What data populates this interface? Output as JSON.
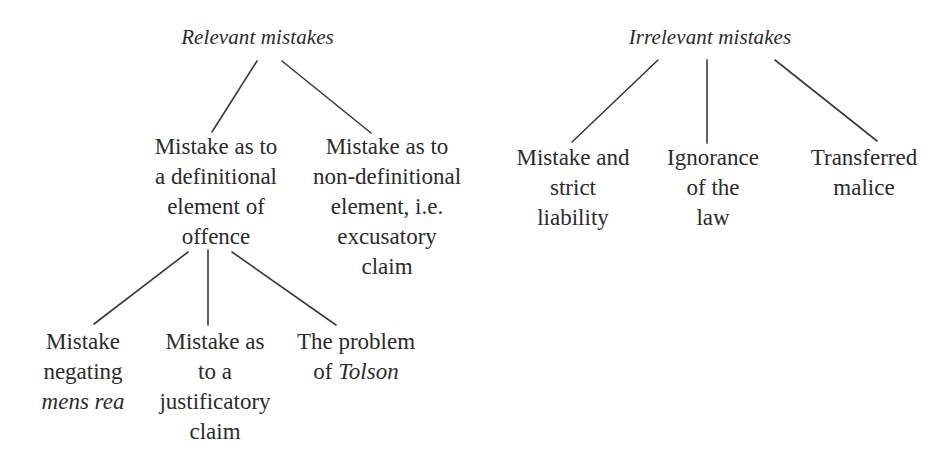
{
  "diagram": {
    "line_color": "#3a3a3a",
    "text_color": "#2b2b2b",
    "background_color": "#ffffff",
    "trees": {
      "relevant": {
        "root": "Relevant mistakes",
        "children": [
          {
            "label": "Mistake as to\na definitional\nelement of\noffence",
            "children": [
              {
                "label_pre": "Mistake\nnegating\n",
                "label_italic": "mens rea",
                "label_post": ""
              },
              {
                "label_pre": "Mistake as\nto a\njustificatory\nclaim",
                "label_italic": "",
                "label_post": ""
              },
              {
                "label_pre": "The problem\nof ",
                "label_italic": "Tolson",
                "label_post": ""
              }
            ]
          },
          {
            "label": "Mistake as to\nnon-definitional\nelement, i.e.\nexcusatory\nclaim",
            "children": []
          }
        ]
      },
      "irrelevant": {
        "root": "Irrelevant mistakes",
        "children": [
          {
            "label": "Mistake and\nstrict\nliability"
          },
          {
            "label": "Ignorance\nof the\nlaw"
          },
          {
            "label": "Transferred\nmalice"
          }
        ]
      }
    },
    "edges": [
      {
        "name": "relevant-to-definitional",
        "x1": 257,
        "y1": 61,
        "x2": 212,
        "y2": 132
      },
      {
        "name": "relevant-to-nondefinitional",
        "x1": 282,
        "y1": 61,
        "x2": 371,
        "y2": 133
      },
      {
        "name": "definitional-to-mens-rea",
        "x1": 188,
        "y1": 252,
        "x2": 94,
        "y2": 324
      },
      {
        "name": "definitional-to-justificatory",
        "x1": 208,
        "y1": 250,
        "x2": 208,
        "y2": 325
      },
      {
        "name": "definitional-to-tolson",
        "x1": 232,
        "y1": 252,
        "x2": 336,
        "y2": 325
      },
      {
        "name": "irrelevant-to-strict-liability",
        "x1": 658,
        "y1": 60,
        "x2": 572,
        "y2": 142
      },
      {
        "name": "irrelevant-to-ignorance",
        "x1": 707,
        "y1": 60,
        "x2": 707,
        "y2": 143
      },
      {
        "name": "irrelevant-to-transferred-malice",
        "x1": 775,
        "y1": 60,
        "x2": 877,
        "y2": 141
      }
    ]
  }
}
